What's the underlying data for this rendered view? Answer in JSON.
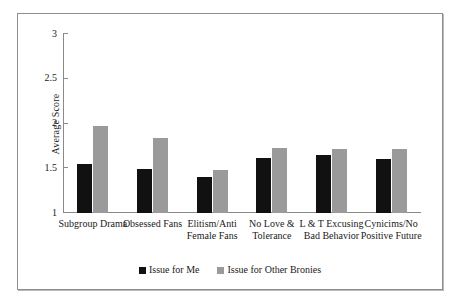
{
  "chart_data": {
    "type": "bar",
    "title": "",
    "xlabel": "",
    "ylabel": "Average Score",
    "ylim": [
      1,
      3
    ],
    "yticks": [
      "1",
      "1.5",
      "2",
      "2.5",
      "3"
    ],
    "grid": false,
    "legend_position": "bottom-center",
    "categories": [
      "Subgroup Drama",
      "Obsessed Fans",
      "Elitism/Anti Female Fans",
      "No Love & Tolerance",
      "L & T Excusing Bad Behavior",
      "Cynicims/No Positive Future"
    ],
    "series": [
      {
        "name": "Issue for Me",
        "color": "#111111",
        "values": [
          1.55,
          1.49,
          1.4,
          1.61,
          1.65,
          1.6
        ]
      },
      {
        "name": "Issue for Other Bronies",
        "color": "#9a9a9a",
        "values": [
          1.97,
          1.84,
          1.48,
          1.73,
          1.71,
          1.71
        ]
      }
    ]
  },
  "legend": {
    "items": [
      {
        "label": "Issue for Me",
        "swatch": "dark"
      },
      {
        "label": "Issue for Other Bronies",
        "swatch": "light"
      }
    ]
  }
}
